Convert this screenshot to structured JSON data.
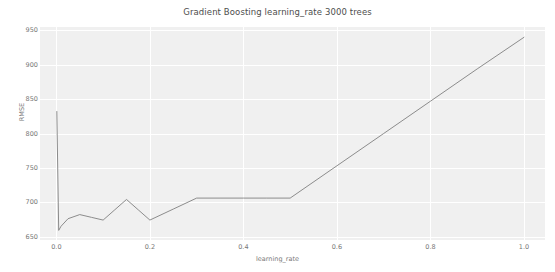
{
  "chart_data": {
    "type": "line",
    "title": "Gradient Boosting learning_rate 3000 trees",
    "xlabel": "learning_rate",
    "ylabel": "RMSE",
    "xlim": [
      -0.035,
      1.045
    ],
    "ylim": [
      645,
      955
    ],
    "xticks": [
      "0.0",
      "0.2",
      "0.4",
      "0.6",
      "0.8",
      "1.0"
    ],
    "xtick_values": [
      0.0,
      0.2,
      0.4,
      0.6,
      0.8,
      1.0
    ],
    "yticks": [
      "650",
      "700",
      "750",
      "800",
      "850",
      "900",
      "950"
    ],
    "ytick_values": [
      650,
      700,
      750,
      800,
      850,
      900,
      950
    ],
    "grid": true,
    "legend": "none",
    "line_color": "#808080",
    "plot_background": "#f0f0f0",
    "grid_color": "#ffffff",
    "series": [
      {
        "name": "RMSE",
        "x": [
          0.001,
          0.005,
          0.01,
          0.025,
          0.05,
          0.075,
          0.1,
          0.125,
          0.15,
          0.175,
          0.2,
          0.25,
          0.3,
          0.35,
          0.4,
          0.45,
          0.5,
          0.6,
          0.7,
          0.8,
          0.9,
          1.0
        ],
        "y": [
          832,
          659,
          665,
          676,
          682,
          678,
          674,
          689,
          704,
          689,
          674,
          690,
          706,
          706,
          706,
          706,
          706,
          753,
          800,
          847,
          894,
          940
        ]
      }
    ]
  },
  "axes": {
    "title": "Gradient Boosting learning_rate 3000 trees",
    "x_axis_label": "learning_rate",
    "y_axis_label": "RMSE"
  }
}
